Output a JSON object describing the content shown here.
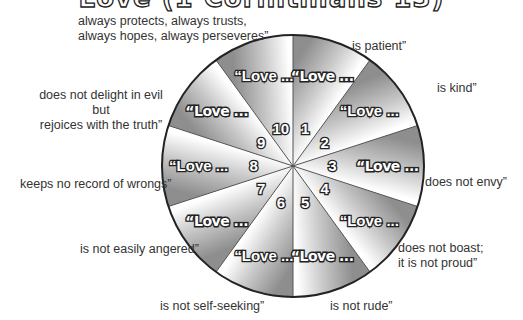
{
  "title": "Love (1 Corinthians 13)",
  "wheel": {
    "segment_prefix": "“Love ...",
    "colors": {
      "dark": "#8e8e8e",
      "light": "#ffffff",
      "outline": "#222222"
    },
    "segments": [
      {
        "number": "1",
        "style": "hollow",
        "phrase": "is patient”"
      },
      {
        "number": "2",
        "style": "solid",
        "phrase": "is kind”"
      },
      {
        "number": "3",
        "style": "hollow",
        "phrase": "does not envy”"
      },
      {
        "number": "4",
        "style": "solid",
        "phrase": "does not boast; it is not proud”"
      },
      {
        "number": "5",
        "style": "hollow",
        "phrase": "is not rude”"
      },
      {
        "number": "6",
        "style": "solid",
        "phrase": "is not self-seeking”"
      },
      {
        "number": "7",
        "style": "hollow",
        "phrase": "is not easily angered”"
      },
      {
        "number": "8",
        "style": "solid",
        "phrase": "keeps no record of wrongs”"
      },
      {
        "number": "9",
        "style": "hollow",
        "phrase": "does not delight in evil but rejoices with the truth”"
      },
      {
        "number": "10",
        "style": "solid",
        "phrase": "always protects, always trusts, always hopes, always perseveres”"
      }
    ]
  },
  "labels": {
    "l1": [
      "is patient”"
    ],
    "l2": [
      "is kind”"
    ],
    "l3": [
      "does not envy”"
    ],
    "l4": [
      "does not boast;",
      "it is not proud”"
    ],
    "l5": [
      "is not rude”"
    ],
    "l6": [
      "is not self-seeking”"
    ],
    "l7": [
      "is not easily angered”"
    ],
    "l8": [
      "keeps no record of wrongs”"
    ],
    "l9": [
      "does not delight in evil",
      "but",
      "rejoices with the truth”"
    ],
    "l10": [
      "always protects, always trusts,",
      "always hopes, always perseveres”"
    ]
  }
}
